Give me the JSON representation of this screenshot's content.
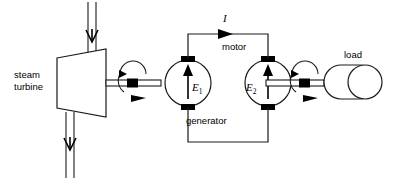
{
  "diagram": {
    "type": "electrical-schematic",
    "background_color": "#ffffff",
    "line_color": "#1a1a1a",
    "labels": {
      "steam_turbine_line1": "steam",
      "steam_turbine_line2": "turbine",
      "generator": "generator",
      "motor": "motor",
      "load": "load",
      "current": "I",
      "generator_emf": "E",
      "generator_emf_subscript": "1",
      "motor_emf": "E",
      "motor_emf_subscript": "2"
    },
    "components": [
      {
        "name": "steam-turbine",
        "shape": "trapezoid",
        "label": "steam turbine",
        "ports": [
          "steam-inlet-pipe-top",
          "steam-outlet-pipe-bottom",
          "shaft-right"
        ]
      },
      {
        "name": "generator",
        "shape": "circle",
        "label": "generator",
        "symbol": "E1",
        "terminals": [
          "top",
          "bottom"
        ]
      },
      {
        "name": "motor",
        "shape": "circle",
        "label": "motor",
        "symbol": "E2",
        "terminals": [
          "top",
          "bottom"
        ]
      },
      {
        "name": "load",
        "shape": "capsule-with-wheel",
        "label": "load"
      }
    ],
    "connections": [
      {
        "name": "turbine-to-generator-shaft",
        "from": "steam-turbine",
        "to": "generator",
        "kind": "mechanical-shaft",
        "has_coupling": true,
        "rotation_arrow": true
      },
      {
        "name": "motor-to-load-shaft",
        "from": "motor",
        "to": "load",
        "kind": "mechanical-shaft",
        "has_coupling": true,
        "rotation_arrow": true
      },
      {
        "name": "top-conductor",
        "from": "generator",
        "to": "motor",
        "kind": "electrical",
        "current_label": "I",
        "current_direction": "left-to-right"
      },
      {
        "name": "bottom-conductor",
        "from": "motor",
        "to": "generator",
        "kind": "electrical"
      }
    ],
    "flows": [
      {
        "name": "steam-inlet",
        "direction": "down",
        "location": "turbine-top"
      },
      {
        "name": "steam-outlet",
        "direction": "down",
        "location": "turbine-bottom"
      }
    ]
  }
}
